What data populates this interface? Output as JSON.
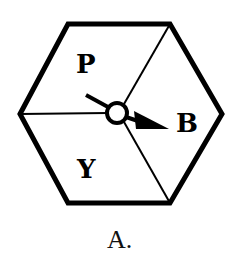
{
  "figure": {
    "caption": "A.",
    "sections": [
      {
        "id": "P",
        "label": "P"
      },
      {
        "id": "B",
        "label": "B"
      },
      {
        "id": "Y",
        "label": "Y"
      }
    ],
    "pointer_target": "B",
    "colors": {
      "stroke": "#000000",
      "background": "#ffffff"
    }
  }
}
